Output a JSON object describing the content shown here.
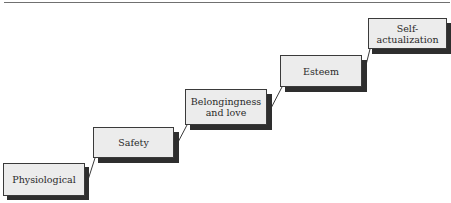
{
  "diagram": {
    "type": "staircase",
    "steps": [
      {
        "label": "Physiological",
        "x": 3,
        "y": 163,
        "w": 82,
        "h": 33
      },
      {
        "label": "Safety",
        "x": 93,
        "y": 127,
        "w": 81,
        "h": 31
      },
      {
        "label": "Belongingness\nand love",
        "x": 185,
        "y": 89,
        "w": 82,
        "h": 36
      },
      {
        "label": "Esteem",
        "x": 280,
        "y": 55,
        "w": 82,
        "h": 32
      },
      {
        "label": "Self-actualization",
        "x": 368,
        "y": 18,
        "w": 79,
        "h": 31
      }
    ],
    "colors": {
      "box_fill": "#ececec",
      "box_border": "#3a3a3a",
      "shadow": "#2e2e2e",
      "connector": "#3a3a3a"
    }
  }
}
